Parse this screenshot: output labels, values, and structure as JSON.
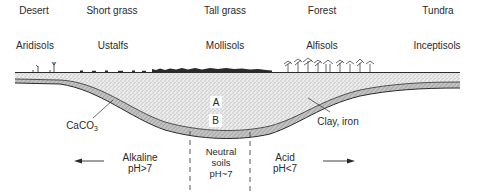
{
  "vegetation": [
    {
      "label": "Desert",
      "x": 34
    },
    {
      "label": "Short grass",
      "x": 112
    },
    {
      "label": "Tall grass",
      "x": 225
    },
    {
      "label": "Forest",
      "x": 322
    },
    {
      "label": "Tundra",
      "x": 438
    }
  ],
  "soil_orders": [
    {
      "label": "Aridisols",
      "x": 35
    },
    {
      "label": "Ustalfs",
      "x": 113
    },
    {
      "label": "Mollisols",
      "x": 225
    },
    {
      "label": "Alfisols",
      "x": 322
    },
    {
      "label": "Inceptisols",
      "x": 437
    }
  ],
  "horizons": {
    "a_label": "A",
    "b_label": "B"
  },
  "annotations": {
    "caco3_main": "CaCO",
    "caco3_sub": "3",
    "clay_iron": "Clay, iron"
  },
  "ph_zones": {
    "alkaline_line1": "Alkaline",
    "alkaline_line2": "pH>7",
    "neutral_line1": "Neutral",
    "neutral_line2": "soils",
    "neutral_line3": "pH~7",
    "acid_line1": "Acid",
    "acid_line2": "pH<7"
  },
  "colors": {
    "ink": "#2a2a2a",
    "stipple_bg": "#e6e6e6",
    "hatch_bg": "#bdbdbd"
  }
}
